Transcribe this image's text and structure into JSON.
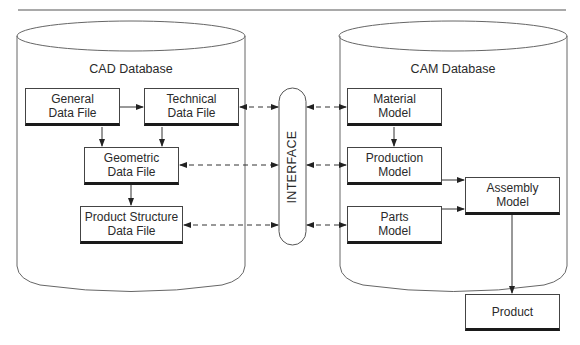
{
  "diagram": {
    "cad": {
      "title": "CAD Database",
      "boxes": {
        "general": {
          "line1": "General",
          "line2": "Data File"
        },
        "technical": {
          "line1": "Technical",
          "line2": "Data File"
        },
        "geometric": {
          "line1": "Geometric",
          "line2": "Data File"
        },
        "product_structure": {
          "line1": "Product Structure",
          "line2": "Data File"
        }
      }
    },
    "interface": {
      "label": "INTERFACE"
    },
    "cam": {
      "title": "CAM Database",
      "boxes": {
        "material": {
          "line1": "Material",
          "line2": "Model"
        },
        "production": {
          "line1": "Production",
          "line2": "Model"
        },
        "parts": {
          "line1": "Parts",
          "line2": "Model"
        },
        "assembly": {
          "line1": "Assembly",
          "line2": "Model"
        }
      }
    },
    "output": {
      "product": {
        "label": "Product"
      }
    }
  }
}
